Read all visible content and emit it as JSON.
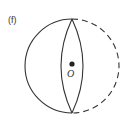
{
  "figure": {
    "panel_label": "(f)",
    "center_label": "O",
    "colors": {
      "stroke": "#333333",
      "background": "#ffffff"
    },
    "shapes": {
      "circle": {
        "cx": 72,
        "cy": 66,
        "r": 47
      },
      "left_arc": "solid",
      "right_arc": "dashed",
      "lens": "solid",
      "center_point": "filled-dot"
    }
  }
}
